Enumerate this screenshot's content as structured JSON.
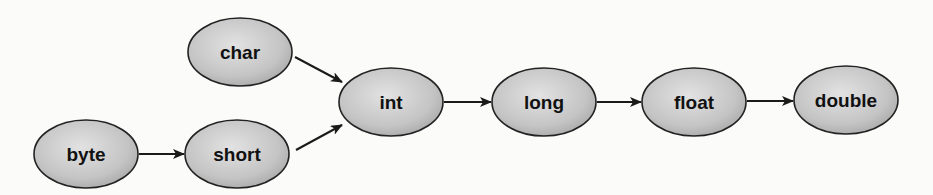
{
  "diagram": {
    "type": "flow",
    "colors": {
      "node_fill": "#c4c4c4",
      "node_stroke": "#222222",
      "edge": "#1a1a1a",
      "background": "#fbfbfa"
    },
    "nodes": [
      {
        "id": "char",
        "label": "char",
        "cx": 240,
        "cy": 52,
        "rx": 52,
        "ry": 34
      },
      {
        "id": "byte",
        "label": "byte",
        "cx": 86,
        "cy": 154,
        "rx": 52,
        "ry": 34
      },
      {
        "id": "short",
        "label": "short",
        "cx": 237,
        "cy": 154,
        "rx": 52,
        "ry": 34
      },
      {
        "id": "int",
        "label": "int",
        "cx": 391,
        "cy": 102,
        "rx": 52,
        "ry": 34
      },
      {
        "id": "long",
        "label": "long",
        "cx": 544,
        "cy": 102,
        "rx": 52,
        "ry": 34
      },
      {
        "id": "float",
        "label": "float",
        "cx": 694,
        "cy": 102,
        "rx": 52,
        "ry": 34
      },
      {
        "id": "double",
        "label": "double",
        "cx": 846,
        "cy": 100,
        "rx": 52,
        "ry": 34
      }
    ],
    "edges": [
      {
        "from": "char",
        "to": "int",
        "x1": 295,
        "y1": 57,
        "x2": 342,
        "y2": 82
      },
      {
        "from": "short",
        "to": "int",
        "x1": 296,
        "y1": 150,
        "x2": 342,
        "y2": 125
      },
      {
        "from": "byte",
        "to": "short",
        "x1": 139,
        "y1": 154,
        "x2": 184,
        "y2": 154
      },
      {
        "from": "int",
        "to": "long",
        "x1": 444,
        "y1": 102,
        "x2": 491,
        "y2": 102
      },
      {
        "from": "long",
        "to": "float",
        "x1": 597,
        "y1": 102,
        "x2": 641,
        "y2": 102
      },
      {
        "from": "float",
        "to": "double",
        "x1": 747,
        "y1": 101,
        "x2": 793,
        "y2": 101
      }
    ]
  }
}
